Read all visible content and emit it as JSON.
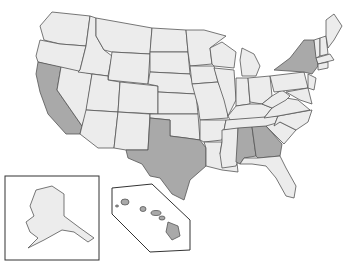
{
  "map": {
    "title": "United States map with highlighted states",
    "colors": {
      "default": "#ececec",
      "highlight": "#a9a9a9",
      "border": "#555555",
      "background": "#ffffff"
    },
    "highlighted_states": [
      "California",
      "Texas",
      "New York",
      "Alabama",
      "Georgia",
      "Hawaii"
    ],
    "insets": [
      "Alaska",
      "Hawaii"
    ]
  }
}
